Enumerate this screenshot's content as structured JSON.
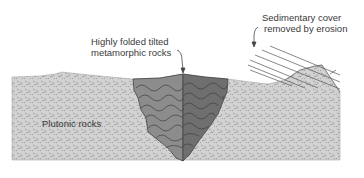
{
  "labels": {
    "metamorphic_line1": "Highly folded tilted",
    "metamorphic_line2": "metamorphic rocks",
    "sedimentary_line1": "Sedimentary cover",
    "sedimentary_line2": "removed by erosion",
    "plutonic": "Plutonic rocks"
  },
  "colors": {
    "plutonic_fill": "#cfcfcf",
    "metamorphic_left": "#8a8a8a",
    "metamorphic_right": "#6e6e6e",
    "line": "#444444",
    "text": "#3a3a3a"
  }
}
